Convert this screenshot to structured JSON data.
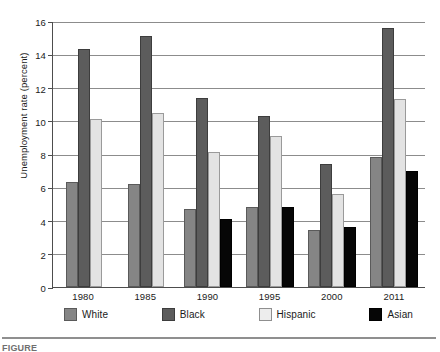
{
  "chart_data": {
    "type": "bar",
    "title": "",
    "xlabel": "",
    "ylabel": "Unemployment rate (percent)",
    "ylim": [
      0,
      16
    ],
    "ytick_step": 2,
    "yticks": [
      "0",
      "2",
      "4",
      "6",
      "8",
      "10",
      "12",
      "14",
      "16"
    ],
    "grid": "horizontal",
    "legend_position": "bottom",
    "categories": [
      "1980",
      "1985",
      "1990",
      "1995",
      "2000",
      "2011"
    ],
    "series": [
      {
        "name": "White",
        "color": "#858585",
        "values": [
          6.3,
          6.2,
          4.7,
          4.8,
          3.4,
          7.8
        ]
      },
      {
        "name": "Black",
        "color": "#5c5c5c",
        "values": [
          14.3,
          15.1,
          11.35,
          10.3,
          7.4,
          15.6
        ]
      },
      {
        "name": "Hispanic",
        "color": "#e3e3e3",
        "values": [
          10.1,
          10.45,
          8.1,
          9.1,
          5.6,
          11.3
        ]
      },
      {
        "name": "Asian",
        "color": "#060606",
        "values": [
          null,
          null,
          4.1,
          4.8,
          3.6,
          7.0
        ]
      }
    ]
  },
  "legend": {
    "items": [
      {
        "label": "White",
        "swatch": "legend-swatch-white"
      },
      {
        "label": "Black",
        "swatch": "legend-swatch-black"
      },
      {
        "label": "Hispanic",
        "swatch": "legend-swatch-hispanic"
      },
      {
        "label": "Asian",
        "swatch": "legend-swatch-asian"
      }
    ]
  },
  "caption": {
    "text": "FIGURE"
  }
}
